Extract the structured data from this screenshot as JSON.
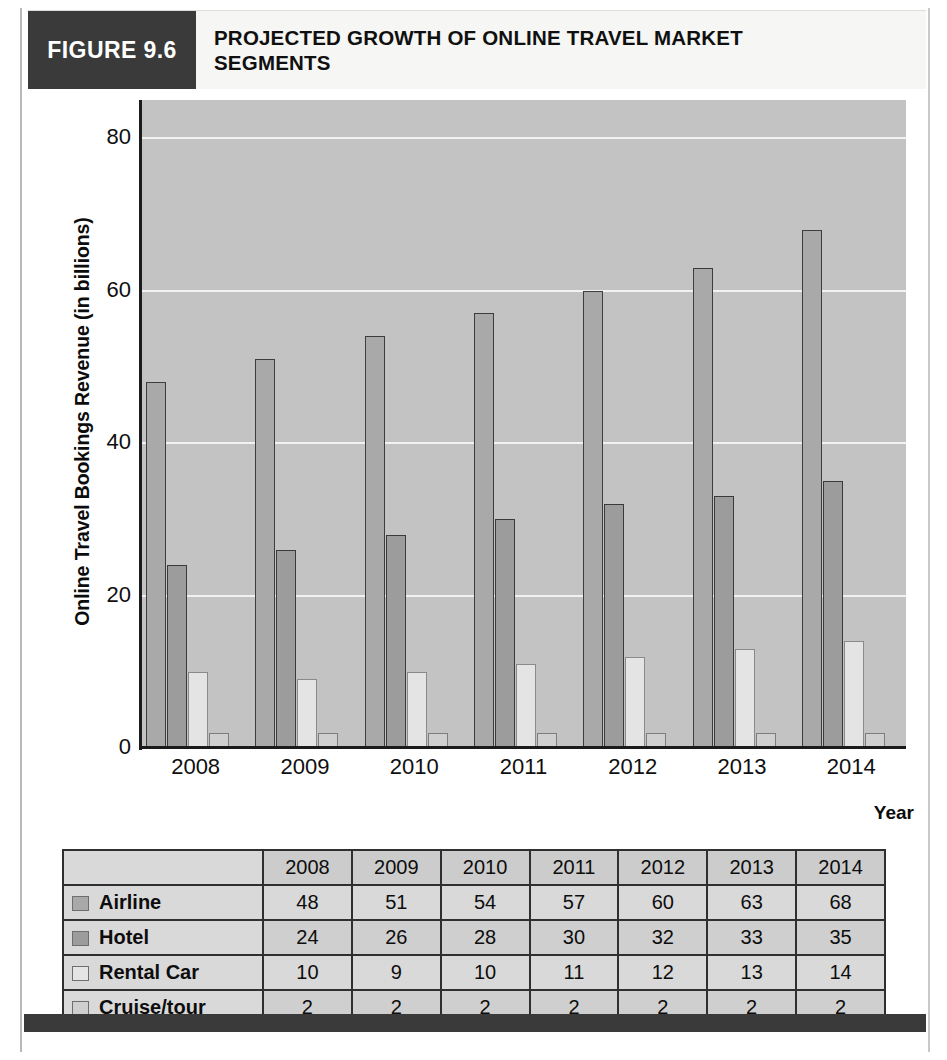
{
  "figure": {
    "badge_label": "FIGURE 9.6",
    "title_line_1": "PROJECTED GROWTH OF ONLINE TRAVEL MARKET",
    "title_line_2": "SEGMENTS"
  },
  "chart_data": {
    "type": "bar",
    "title": "PROJECTED GROWTH OF ONLINE TRAVEL MARKET SEGMENTS",
    "xlabel": "Year",
    "ylabel": "Online Travel Bookings Revenue (in billions)",
    "categories": [
      "2008",
      "2009",
      "2010",
      "2011",
      "2012",
      "2013",
      "2014"
    ],
    "series": [
      {
        "name": "Airline",
        "values": [
          48,
          51,
          54,
          57,
          60,
          63,
          68
        ],
        "color": "#a9a9a9"
      },
      {
        "name": "Hotel",
        "values": [
          24,
          26,
          28,
          30,
          32,
          33,
          35
        ],
        "color": "#9c9c9c"
      },
      {
        "name": "Rental Car",
        "values": [
          10,
          9,
          10,
          11,
          12,
          13,
          14
        ],
        "color": "#e4e4e4"
      },
      {
        "name": "Cruise/tour",
        "values": [
          2,
          2,
          2,
          2,
          2,
          2,
          2
        ],
        "color": "#cfcfcf"
      }
    ],
    "ylim": [
      0,
      85
    ],
    "yticks": [
      0,
      20,
      40,
      60,
      80
    ],
    "ytick_labels": [
      "0",
      "20",
      "40",
      "60",
      "80"
    ],
    "grid": true,
    "legend_position": "table-row-labels",
    "plot_background": "#c3c3c3",
    "gridline_color": "#f2f2f2"
  },
  "table": {
    "corner_label": "",
    "column_headers": [
      "2008",
      "2009",
      "2010",
      "2011",
      "2012",
      "2013",
      "2014"
    ],
    "rows": [
      {
        "label": "Airline",
        "swatch": "#a9a9a9",
        "values": [
          "48",
          "51",
          "54",
          "57",
          "60",
          "63",
          "68"
        ]
      },
      {
        "label": "Hotel",
        "swatch": "#9c9c9c",
        "values": [
          "24",
          "26",
          "28",
          "30",
          "32",
          "33",
          "35"
        ]
      },
      {
        "label": "Rental Car",
        "swatch": "#e4e4e4",
        "values": [
          "10",
          "9",
          "10",
          "11",
          "12",
          "13",
          "14"
        ]
      },
      {
        "label": "Cruise/tour",
        "swatch": "#cfcfcf",
        "values": [
          "2",
          "2",
          "2",
          "2",
          "2",
          "2",
          "2"
        ]
      }
    ]
  }
}
